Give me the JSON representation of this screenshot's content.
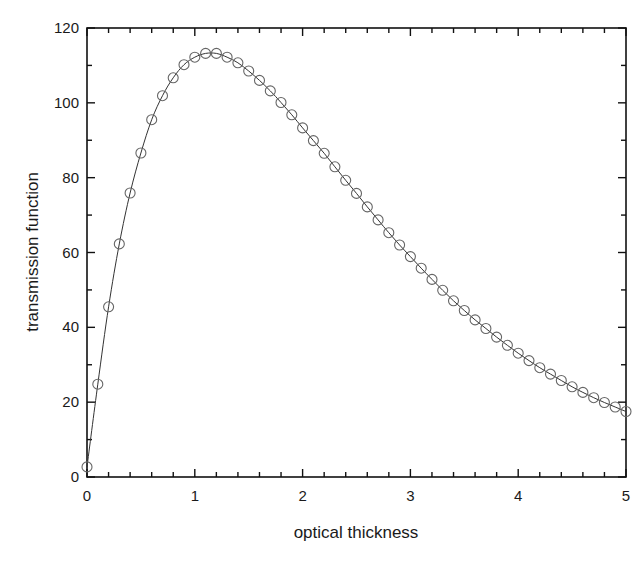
{
  "chart_data": {
    "type": "line",
    "title": "",
    "xlabel": "optical thickness",
    "ylabel": "transmission function",
    "xlim": [
      0,
      5
    ],
    "ylim": [
      0,
      120
    ],
    "x_ticks": [
      0,
      1,
      2,
      3,
      4,
      5
    ],
    "y_ticks": [
      0,
      20,
      40,
      60,
      80,
      100,
      120
    ],
    "x_minor_step": 0.2,
    "y_minor_step": 10,
    "grid": false,
    "legend": null,
    "series": [
      {
        "name": "transmission function",
        "style": "line with open circle markers",
        "line_color": "#333333",
        "marker_color": "#666666",
        "x": [
          0,
          0.1,
          0.2,
          0.3,
          0.4,
          0.5,
          0.6,
          0.7,
          0.8,
          0.9,
          1.0,
          1.1,
          1.2,
          1.3,
          1.4,
          1.5,
          1.6,
          1.7,
          1.8,
          1.9,
          2.0,
          2.1,
          2.2,
          2.3,
          2.4,
          2.5,
          2.6,
          2.7,
          2.8,
          2.9,
          3.0,
          3.1,
          3.2,
          3.3,
          3.4,
          3.5,
          3.6,
          3.7,
          3.8,
          3.9,
          4.0,
          4.1,
          4.2,
          4.3,
          4.4,
          4.5,
          4.6,
          4.7,
          4.8,
          4.9,
          5.0
        ],
        "values": [
          2.7,
          24.8,
          45.5,
          62.3,
          75.9,
          86.6,
          95.5,
          101.9,
          106.7,
          110.2,
          112.2,
          113.2,
          113.2,
          112.2,
          110.7,
          108.5,
          106.0,
          103.2,
          100.1,
          96.8,
          93.3,
          89.9,
          86.5,
          82.9,
          79.3,
          75.8,
          72.2,
          68.7,
          65.3,
          62.0,
          58.9,
          55.8,
          52.8,
          49.9,
          47.1,
          44.5,
          42.0,
          39.7,
          37.4,
          35.2,
          33.1,
          31.1,
          29.2,
          27.5,
          25.8,
          24.1,
          22.6,
          21.2,
          19.9,
          18.7,
          17.5
        ]
      }
    ]
  }
}
